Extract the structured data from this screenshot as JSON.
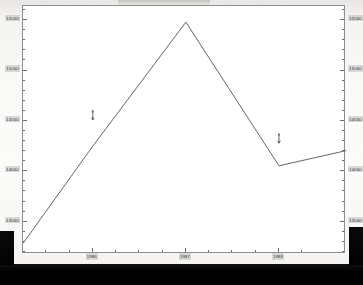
{
  "document": {
    "kind": "scanned-figure",
    "background_tone": "#fbfbfa"
  },
  "artifacts": {
    "bottom_band_label": "",
    "left_block_label": "",
    "right_block_label": "",
    "top_smudge_label": ""
  },
  "chart_data": {
    "type": "line",
    "title": "",
    "subtitle": "",
    "xlabel": "",
    "ylabel": "",
    "grid": false,
    "legend": null,
    "dual_y_axis": true,
    "x": [
      1985.25,
      1986.0,
      1987.0,
      1988.0,
      1988.72
    ],
    "series": [
      {
        "name": "series-1",
        "values": [
          13285,
          14250,
          15480,
          14055,
          14205
        ]
      }
    ],
    "x_tick_labels": [
      "1986",
      "1987",
      "1988"
    ],
    "x_tick_values": [
      1986,
      1987,
      1988
    ],
    "xlim": [
      1985.25,
      1988.72
    ],
    "y_tick_labels_left": [
      "15500",
      "15000",
      "14500",
      "14000",
      "13500"
    ],
    "y_tick_labels_right": [
      "15500",
      "15000",
      "14500",
      "14000",
      "13500"
    ],
    "y_tick_values": [
      15500,
      15000,
      14500,
      14000,
      13500
    ],
    "ylim": [
      13180,
      15640
    ],
    "y_minor_tick_step": 100,
    "line_color": "#555555",
    "axis_color": "#8d8d8d",
    "text_color": "#3a3a3a",
    "annotations": [
      {
        "name": "marker-1",
        "x": 1986.0,
        "y": 14560,
        "glyph": "dagger-arrow"
      },
      {
        "name": "marker-2",
        "x": 1988.0,
        "y": 14330,
        "glyph": "dagger-arrow"
      }
    ]
  }
}
